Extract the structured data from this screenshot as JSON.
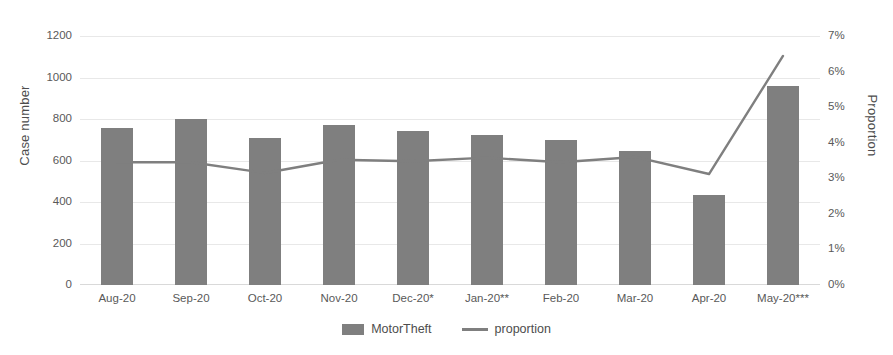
{
  "chart_data": {
    "type": "bar",
    "title": "",
    "xlabel": "",
    "ylabel": "Case number",
    "y2label": "Proportion",
    "categories": [
      "Aug-20",
      "Sep-20",
      "Oct-20",
      "Nov-20",
      "Dec-20*",
      "Jan-20**",
      "Feb-20",
      "Mar-20",
      "Apr-20",
      "May-20***"
    ],
    "ylim": [
      0,
      1200
    ],
    "y2lim": [
      0,
      7
    ],
    "yticks": [
      "0",
      "200",
      "400",
      "600",
      "800",
      "1000",
      "1200"
    ],
    "y2ticks": [
      "0%",
      "1%",
      "2%",
      "3%",
      "4%",
      "5%",
      "6%",
      "7%"
    ],
    "grid": true,
    "legend_position": "bottom",
    "series": [
      {
        "name": "MotorTheft",
        "type": "bar",
        "axis": "left",
        "color": "#7f7f7f",
        "values": [
          757,
          800,
          708,
          772,
          740,
          722,
          700,
          645,
          435,
          957
        ]
      },
      {
        "name": "proportion",
        "type": "line",
        "axis": "right",
        "color": "#7f7f7f",
        "unit": "%",
        "values": [
          3.45,
          3.45,
          3.15,
          3.52,
          3.48,
          3.58,
          3.45,
          3.6,
          3.12,
          6.44
        ]
      }
    ]
  },
  "legend": {
    "items": [
      {
        "label": "MotorTheft",
        "marker": "bar-swatch"
      },
      {
        "label": "proportion",
        "marker": "line-swatch"
      }
    ]
  }
}
